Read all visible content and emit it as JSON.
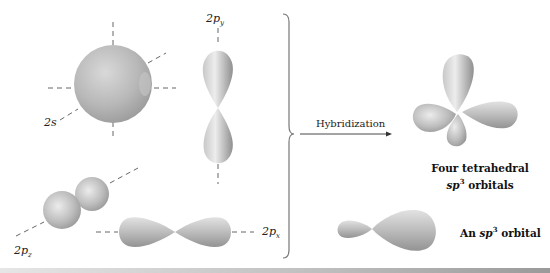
{
  "figure": {
    "atomic_orbitals": {
      "s_label": "2s",
      "py_label": {
        "main": "2p",
        "sub": "y"
      },
      "pz_label": {
        "main": "2p",
        "sub": "z"
      },
      "px_label": {
        "main": "2p",
        "sub": "x"
      }
    },
    "arrow": {
      "label": "Hybridization"
    },
    "hybrid": {
      "tetrahedral_caption_line1": "Four tetrahedral",
      "tetrahedral_caption_line2_italic": "sp",
      "tetrahedral_caption_line2_sup": "3",
      "tetrahedral_caption_line2_rest": " orbitals",
      "single_caption_prefix": "An ",
      "single_caption_italic": "sp",
      "single_caption_sup": "3",
      "single_caption_rest": " orbital"
    },
    "colors": {
      "orbital_light": "#e8e8e8",
      "orbital_mid": "#b5b5b5",
      "orbital_dark": "#8a8a8a",
      "axis_dash": "#555555",
      "brace": "#777777"
    }
  }
}
